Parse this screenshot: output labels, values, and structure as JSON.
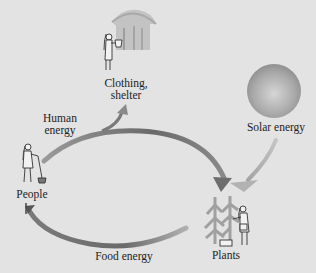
{
  "diagram": {
    "type": "energy-flow-cycle",
    "nodes": [
      {
        "id": "clothing_shelter",
        "label_line1": "Clothing,",
        "label_line2": "shelter",
        "icon": "hut-with-person-icon"
      },
      {
        "id": "solar",
        "label": "Solar energy",
        "icon": "sun-sphere-icon"
      },
      {
        "id": "people",
        "label": "People",
        "icon": "person-farming-icon"
      },
      {
        "id": "plants",
        "label": "Plants",
        "icon": "plants-with-person-icon"
      }
    ],
    "edges": [
      {
        "from": "people",
        "to": "plants",
        "label_line1": "Human",
        "label_line2": "energy",
        "branch_to": "clothing_shelter"
      },
      {
        "from": "solar",
        "to": "plants",
        "label": ""
      },
      {
        "from": "plants",
        "to": "people",
        "label": "Food energy"
      }
    ]
  },
  "colors": {
    "background": "#e3e3e3",
    "arrow_dark": "#6e6e6e",
    "arrow_light": "#b5b5b5",
    "text": "#222222"
  }
}
